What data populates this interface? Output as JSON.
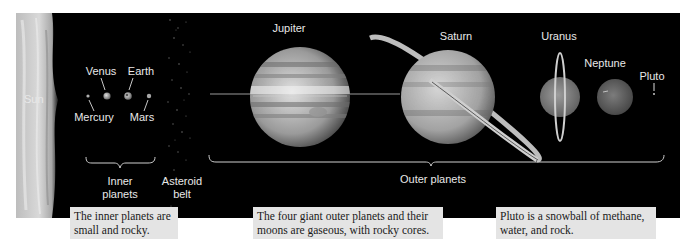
{
  "figure": {
    "colors": {
      "background": "#ffffff",
      "space": "#000000",
      "label_text": "#e8e8e8",
      "caption_bg": "#e4e4e4",
      "caption_text": "#1a1a1a"
    },
    "bodies": [
      {
        "id": "sun",
        "label": "Sun"
      },
      {
        "id": "mercury",
        "label": "Mercury"
      },
      {
        "id": "venus",
        "label": "Venus"
      },
      {
        "id": "earth",
        "label": "Earth"
      },
      {
        "id": "mars",
        "label": "Mars"
      },
      {
        "id": "jupiter",
        "label": "Jupiter"
      },
      {
        "id": "saturn",
        "label": "Saturn"
      },
      {
        "id": "uranus",
        "label": "Uranus"
      },
      {
        "id": "neptune",
        "label": "Neptune"
      },
      {
        "id": "pluto",
        "label": "Pluto"
      }
    ],
    "groups": {
      "inner": {
        "label_line1": "Inner",
        "label_line2": "planets"
      },
      "asteroid": {
        "label_line1": "Asteroid",
        "label_line2": "belt"
      },
      "outer": {
        "label": "Outer planets"
      }
    },
    "captions": [
      {
        "id": "inner",
        "line1": "The inner planets are",
        "line2": "small and rocky."
      },
      {
        "id": "outer",
        "line1": "The four giant outer planets and their",
        "line2": "moons are gaseous, with rocky cores."
      },
      {
        "id": "pluto",
        "line1": "Pluto is a snowball of methane,",
        "line2": "water, and rock."
      }
    ]
  }
}
